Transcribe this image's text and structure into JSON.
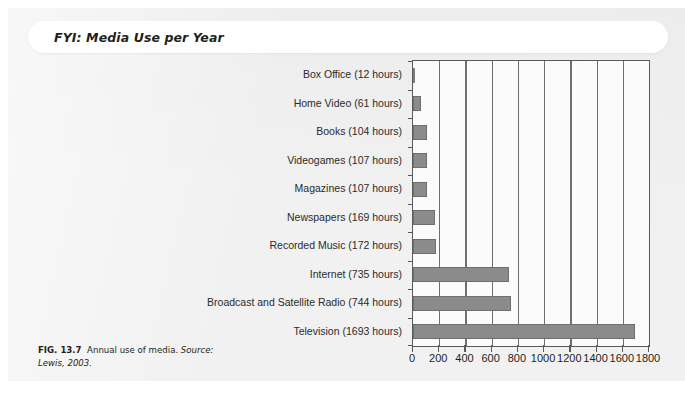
{
  "panel": {
    "header_label": "FYI:  Media Use per Year"
  },
  "caption": {
    "figure_number": "FIG. 13.7",
    "title": "Annual use of media.",
    "source_label": "Source:",
    "source_value": "Lewis, 2003."
  },
  "colors": {
    "panel_background": "#f1f1f1",
    "page_background": "#ffffff",
    "bar_fill": "#8b8b8b",
    "axis": "#58595b",
    "gridline": "#6e6f71",
    "text": "#231f20"
  },
  "chart_data": {
    "type": "bar",
    "orientation": "horizontal",
    "title": "",
    "xlabel": "",
    "ylabel": "",
    "xlim": [
      0,
      1800
    ],
    "xticks": [
      0,
      200,
      400,
      600,
      800,
      1000,
      1200,
      1400,
      1600,
      1800
    ],
    "xticklabels": [
      "0",
      "200",
      "400",
      "600",
      "800",
      "1000",
      "1200",
      "1400",
      "1600",
      "1800"
    ],
    "grid": "vertical",
    "legend": null,
    "units": "hours per year",
    "categories": [
      "Box Office (12 hours)",
      "Home Video (61 hours)",
      "Books (104 hours)",
      "Videogames (107 hours)",
      "Magazines (107 hours)",
      "Newspapers (169 hours)",
      "Recorded Music (172 hours)",
      "Internet (735 hours)",
      "Broadcast and Satellite Radio (744 hours)",
      "Television (1693 hours)"
    ],
    "values": [
      12,
      61,
      104,
      107,
      107,
      169,
      172,
      735,
      744,
      1693
    ]
  }
}
